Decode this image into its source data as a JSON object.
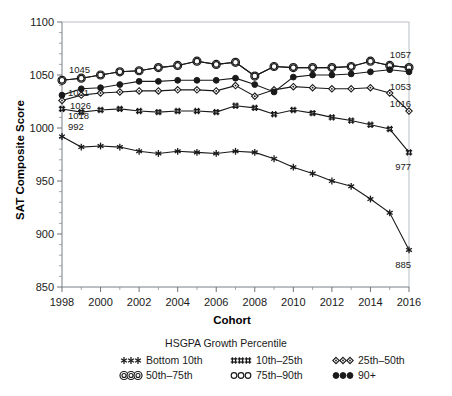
{
  "chart_data": {
    "type": "line",
    "title": "",
    "xlabel": "Cohort",
    "ylabel": "SAT Composite Score",
    "xlim": [
      1998,
      2016
    ],
    "ylim": [
      850,
      1100
    ],
    "ytick_labels": [
      "850",
      "900",
      "950",
      "1000",
      "1050",
      "1100"
    ],
    "yticks": [
      850,
      900,
      950,
      1000,
      1050,
      1100
    ],
    "xtick_labels": [
      "1998",
      "2000",
      "2002",
      "2004",
      "2006",
      "2008",
      "2010",
      "2012",
      "2014",
      "2016"
    ],
    "xticks": [
      1998,
      2000,
      2002,
      2004,
      2006,
      2008,
      2010,
      2012,
      2014,
      2016
    ],
    "minor_xticks_every": 1,
    "grid": false,
    "legend_position": "bottom",
    "legend_title": "HSGPA Growth Percentile",
    "x": [
      1998,
      1999,
      2000,
      2001,
      2002,
      2003,
      2004,
      2005,
      2006,
      2007,
      2008,
      2009,
      2010,
      2011,
      2012,
      2013,
      2014,
      2015,
      2016
    ],
    "series": [
      {
        "name": "Bottom 10th",
        "marker": "asterisk",
        "values": [
          992,
          982,
          983,
          982,
          978,
          976,
          978,
          977,
          976,
          978,
          977,
          971,
          963,
          957,
          950,
          945,
          933,
          920,
          885
        ],
        "start_label": "992",
        "end_label": "885"
      },
      {
        "name": "10th–25th",
        "marker": "hash",
        "values": [
          1018,
          1015,
          1017,
          1018,
          1016,
          1015,
          1016,
          1016,
          1015,
          1021,
          1019,
          1013,
          1017,
          1014,
          1010,
          1007,
          1003,
          999,
          977
        ],
        "start_label": "1018",
        "end_label": "977"
      },
      {
        "name": "25th–50th",
        "marker": "diamond",
        "values": [
          1026,
          1031,
          1033,
          1034,
          1035,
          1035,
          1036,
          1036,
          1035,
          1040,
          1030,
          1036,
          1039,
          1038,
          1037,
          1037,
          1038,
          1033,
          1016
        ],
        "start_label": "1026",
        "end_label": "1016"
      },
      {
        "name": "50th–75th",
        "marker": "double-circle",
        "values": [
          1045,
          1047,
          1050,
          1053,
          1054,
          1057,
          1059,
          1063,
          1060,
          1062,
          1049,
          1058,
          1057,
          1057,
          1057,
          1058,
          1063,
          1059,
          1057
        ],
        "start_label": "1045",
        "end_label": "1057"
      },
      {
        "name": "75th–90th",
        "marker": "circle",
        "values": [
          1045,
          1047,
          1050,
          1053,
          1054,
          1057,
          1059,
          1063,
          1060,
          1062,
          1049,
          1058,
          1057,
          1057,
          1057,
          1058,
          1063,
          1059,
          1057
        ],
        "start_label": "",
        "end_label": ""
      },
      {
        "name": "90+",
        "marker": "filled-circle",
        "values": [
          1031,
          1037,
          1038,
          1041,
          1044,
          1044,
          1045,
          1045,
          1045,
          1047,
          1041,
          1034,
          1048,
          1050,
          1050,
          1051,
          1053,
          1055,
          1053
        ],
        "start_label": "1031",
        "end_label": "1053"
      }
    ]
  },
  "colors": {
    "ink": "#1a1a1a",
    "axis": "#9aa0a6",
    "border": "#b9bec4",
    "background": "#ffffff"
  }
}
